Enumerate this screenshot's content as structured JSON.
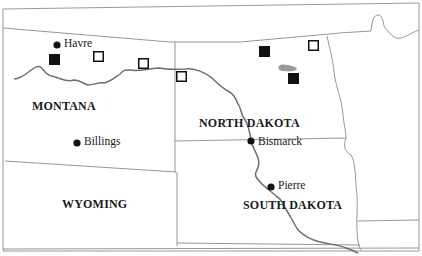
{
  "map": {
    "states": [
      {
        "id": "montana",
        "label": "MONTANA",
        "x": 32,
        "y": 106
      },
      {
        "id": "north-dakota",
        "label": "NORTH DAKOTA",
        "x": 199,
        "y": 123
      },
      {
        "id": "wyoming",
        "label": "WYOMING",
        "x": 62,
        "y": 204
      },
      {
        "id": "south-dakota",
        "label": "SOUTH DAKOTA",
        "x": 243,
        "y": 205
      }
    ],
    "cities": [
      {
        "id": "havre",
        "label": "Havre",
        "dot_x": 57,
        "dot_y": 45,
        "label_x": 64,
        "label_y": 38
      },
      {
        "id": "billings",
        "label": "Billings",
        "dot_x": 77,
        "dot_y": 143,
        "label_x": 84,
        "label_y": 136
      },
      {
        "id": "bismarck",
        "label": "Bismarck",
        "dot_x": 251,
        "dot_y": 141,
        "label_x": 258,
        "label_y": 136
      },
      {
        "id": "pierre",
        "label": "Pierre",
        "dot_x": 271,
        "dot_y": 187,
        "label_x": 278,
        "label_y": 180
      }
    ],
    "markers": {
      "filled_squares": [
        {
          "x": 49,
          "y": 54
        },
        {
          "x": 259,
          "y": 46
        },
        {
          "x": 288,
          "y": 73
        }
      ],
      "open_squares": [
        {
          "x": 93,
          "y": 51
        },
        {
          "x": 138,
          "y": 58
        },
        {
          "x": 176,
          "y": 71
        },
        {
          "x": 308,
          "y": 40
        }
      ]
    },
    "colors": {
      "border": "#8a8a8a",
      "river": "#6e6e6e",
      "lake": "#9a9a9a",
      "marker": "#111111",
      "text": "#1a1a1a"
    }
  }
}
